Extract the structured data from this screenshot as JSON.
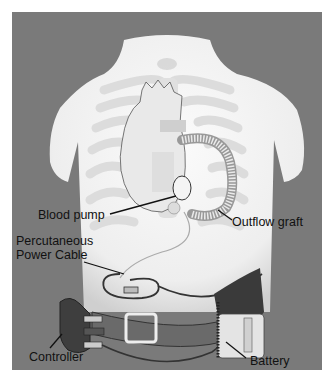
{
  "figure": {
    "background_color": "#7a7a7a",
    "torso_color": "#f2f2f2",
    "labels": {
      "blood_pump": "Blood pump",
      "outflow_graft": "Outflow graft",
      "power_cable_line1": "Percutaneous",
      "power_cable_line2": "Power Cable",
      "controller": "Controller",
      "battery": "Battery"
    }
  }
}
